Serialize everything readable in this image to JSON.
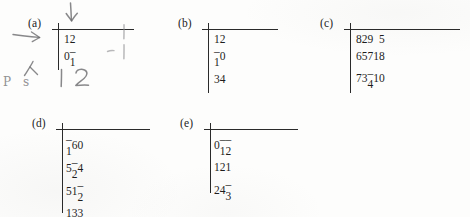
{
  "page": {
    "kind": "scanned-exercise-matrices",
    "background_color": "#fdfdfc",
    "ink_color": "#1d1d1d",
    "pencil_color": "#6e6e70"
  },
  "matrices": [
    {
      "label": "(a)",
      "rows": 2,
      "cols": 2,
      "values": [
        [
          "1",
          "2"
        ],
        [
          "0",
          "–1"
        ]
      ]
    },
    {
      "label": "(b)",
      "rows": 3,
      "cols": 2,
      "values": [
        [
          "1",
          "2"
        ],
        [
          "–1",
          "0"
        ],
        [
          "3",
          "4"
        ]
      ]
    },
    {
      "label": "(c)",
      "rows": 3,
      "cols": 4,
      "values": [
        [
          "8",
          "2",
          "9",
          "5"
        ],
        [
          "6",
          "5",
          "7",
          "18"
        ],
        [
          "7",
          "3",
          "–4",
          "10"
        ]
      ]
    },
    {
      "label": "(d)",
      "rows": 4,
      "cols": 3,
      "values": [
        [
          "–1",
          "6",
          "0"
        ],
        [
          "5",
          "–2",
          "4"
        ],
        [
          "5",
          "1",
          "–2"
        ],
        [
          "1",
          "3",
          "3"
        ]
      ]
    },
    {
      "label": "(e)",
      "rows": 3,
      "cols": 3,
      "values": [
        [
          "0",
          "–1",
          "–2"
        ],
        [
          "1",
          "2",
          "1"
        ],
        [
          "2",
          "4",
          "–3"
        ]
      ]
    }
  ],
  "annotations": {
    "down_arrow": "↓",
    "right_arrow": "→",
    "caret_mark": "∧",
    "scribble_label": "P s",
    "handwritten_digits": [
      "1",
      "2"
    ],
    "tick_marks": [
      "|",
      "|"
    ],
    "dash_mark": "–"
  }
}
